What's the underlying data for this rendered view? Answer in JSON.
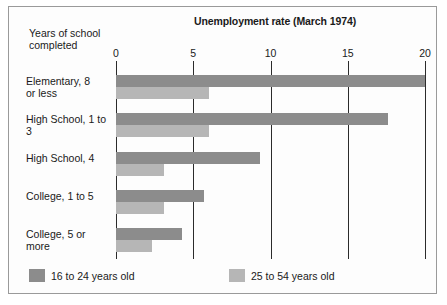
{
  "chart_data": {
    "type": "bar",
    "orientation": "horizontal",
    "title": "Unemployment rate (March 1974)",
    "ylabel": "Years of school\ncompleted",
    "xlabel": "",
    "xlim": [
      0,
      20
    ],
    "xticks": [
      0,
      5,
      10,
      15,
      20
    ],
    "xtick_labels": [
      "0",
      "5",
      "10",
      "15",
      "20"
    ],
    "grid": true,
    "legend_position": "bottom-left",
    "categories": [
      "Elementary, 8\nor less",
      "High School, 1 to 3",
      "High School, 4",
      "College, 1 to 5",
      "College, 5 or more"
    ],
    "series": [
      {
        "name": "16 to 24 years old",
        "color": "#8c8c8c",
        "values": [
          20.0,
          17.6,
          9.3,
          5.7,
          4.3
        ]
      },
      {
        "name": "25 to 54 years old",
        "color": "#b6b6b6",
        "values": [
          6.0,
          6.0,
          3.1,
          3.1,
          2.3
        ]
      }
    ]
  },
  "legend": {
    "items": [
      {
        "label": "16 to 24 years old",
        "color": "#8c8c8c"
      },
      {
        "label": "25 to 54 years old",
        "color": "#b6b6b6"
      }
    ]
  }
}
